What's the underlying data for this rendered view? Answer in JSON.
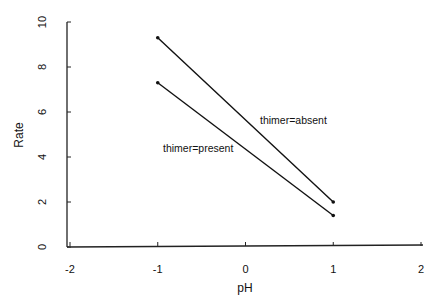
{
  "chart_data": {
    "type": "line",
    "title": "",
    "xlabel": "pH",
    "ylabel": "Rate",
    "xlim": [
      -2,
      2
    ],
    "ylim": [
      0,
      10
    ],
    "xticks": [
      "-2",
      "-1",
      "0",
      "1",
      "2"
    ],
    "yticks": [
      "0",
      "2",
      "4",
      "6",
      "8",
      "10"
    ],
    "grid": false,
    "legend": "inline labels",
    "series": [
      {
        "name": "thimer=absent",
        "x": [
          -1,
          1
        ],
        "values": [
          9.3,
          2.0
        ]
      },
      {
        "name": "thimer=present",
        "x": [
          -1,
          1
        ],
        "values": [
          7.3,
          1.4
        ]
      }
    ]
  },
  "colors": {
    "line": "#111111",
    "axis": "#222222"
  }
}
